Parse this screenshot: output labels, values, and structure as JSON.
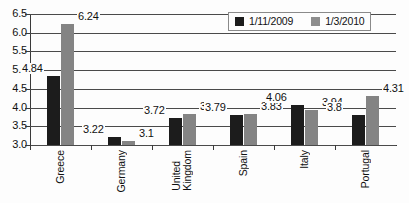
{
  "chart_data": {
    "type": "bar",
    "title": "",
    "xlabel": "",
    "ylabel": "",
    "ylim": [
      3.0,
      6.5
    ],
    "ystep": 0.5,
    "grid": true,
    "legend_position": "top-right",
    "categories": [
      "Greece",
      "Germany",
      "United Kingdom",
      "Spain",
      "Italy",
      "Portugal"
    ],
    "category_lines": [
      [
        "Greece"
      ],
      [
        "Germany"
      ],
      [
        "United",
        "Kingdom"
      ],
      [
        "Spain"
      ],
      [
        "Italy"
      ],
      [
        "Portugal"
      ]
    ],
    "ytick_labels": [
      "6.5",
      "6.0",
      "5.5",
      "5.0",
      "4.5",
      "4.0",
      "3.5",
      "3.0"
    ],
    "ytick_values": [
      6.5,
      6.0,
      5.5,
      5.0,
      4.5,
      4.0,
      3.5,
      3.0
    ],
    "series": [
      {
        "name": "1/11/2009",
        "color": "#1c1c1c",
        "values": [
          4.84,
          3.22,
          3.72,
          3.79,
          4.06,
          3.8
        ],
        "labels": [
          "4.84",
          "3.22",
          "3.72",
          "3.79",
          "4.06",
          "3.8"
        ]
      },
      {
        "name": "1/3/2010",
        "color": "#848484",
        "values": [
          6.24,
          3.1,
          3.83,
          3.83,
          3.94,
          4.31
        ],
        "labels": [
          "6.24",
          "3.1",
          "3.83",
          "3.83",
          "3.83",
          "4.31"
        ]
      }
    ]
  },
  "legend": {
    "items": [
      {
        "label": "1/11/2009",
        "swatch": "legend-swatch-black"
      },
      {
        "label": "1/3/2010",
        "swatch": "legend-swatch-gray"
      }
    ]
  },
  "series2_labels_fixed": [
    "6.24",
    "3.1",
    "3.83",
    "3.83",
    "3.94",
    "4.31"
  ]
}
